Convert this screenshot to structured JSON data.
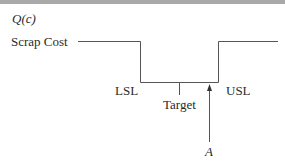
{
  "diagram": {
    "y_axis_label": "Q(c)",
    "level_label": "Scrap Cost",
    "lower_limit_label": "LSL",
    "target_label": "Target",
    "upper_limit_label": "USL",
    "point_label": "A",
    "colors": {
      "line": "#555555",
      "text": "#2a2a2a",
      "top_bar": "#a9a9a9"
    }
  }
}
